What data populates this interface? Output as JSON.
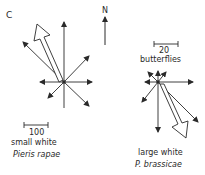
{
  "panel_label": "C",
  "north_label": "N",
  "left_rose": {
    "scale_value": "100",
    "common_name": "small white",
    "species": "Pieris rapae"
  },
  "right_rose": {
    "scale_value": "20",
    "scale_unit": "butterflies",
    "common_name": "large white",
    "species": "P. brassicae"
  },
  "colors": {
    "line": "#2a2a2a",
    "background": "#ffffff"
  }
}
